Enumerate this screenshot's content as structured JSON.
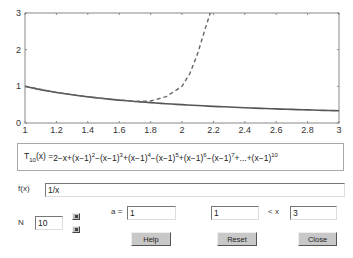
{
  "chart_data": {
    "type": "line",
    "title": "",
    "xlabel": "",
    "ylabel": "",
    "xlim": [
      1,
      3
    ],
    "ylim": [
      0,
      3
    ],
    "grid": false,
    "x_ticks": [
      "1",
      "1.2",
      "1.4",
      "1.6",
      "1.8",
      "2",
      "2.2",
      "2.4",
      "2.6",
      "2.8",
      "3"
    ],
    "y_ticks": [
      "0",
      "1",
      "2",
      "3"
    ],
    "series": [
      {
        "name": "f(x) = 1/x",
        "style": "solid",
        "x": [
          1.0,
          1.2,
          1.4,
          1.6,
          1.8,
          2.0,
          2.2,
          2.4,
          2.6,
          2.8,
          3.0
        ],
        "y": [
          1.0,
          0.833,
          0.714,
          0.625,
          0.556,
          0.5,
          0.455,
          0.417,
          0.385,
          0.357,
          0.333
        ]
      },
      {
        "name": "T10(x)",
        "style": "dashed",
        "x": [
          1.0,
          1.2,
          1.4,
          1.6,
          1.7,
          1.8,
          1.9,
          2.0,
          2.05,
          2.1,
          2.15,
          2.18
        ],
        "y": [
          1.0,
          0.833,
          0.714,
          0.625,
          0.59,
          0.6,
          0.72,
          1.0,
          1.35,
          1.9,
          2.6,
          3.0
        ]
      }
    ]
  },
  "formula": {
    "lhs_T": "T",
    "lhs_sub": "10",
    "lhs_arg": "(x) = ",
    "terms": [
      {
        "text": "2−x+(x−1)",
        "sup": "2"
      },
      {
        "text": "−(x−1)",
        "sup": "3"
      },
      {
        "text": "+(x−1)",
        "sup": "4"
      },
      {
        "text": "−(x−1)",
        "sup": "5"
      },
      {
        "text": "+(x−1)",
        "sup": "6"
      },
      {
        "text": "−(x−1)",
        "sup": "7"
      },
      {
        "text": "+...+(x−1)",
        "sup": "10"
      }
    ]
  },
  "controls": {
    "fx_label": "f(x)",
    "fx_value": "1/x",
    "a_label": "a =",
    "a_value": "1",
    "xmin_value": "1",
    "lt_x_label": "< x",
    "xmax_value": "3",
    "n_label": "N",
    "n_value": "10",
    "help_label": "Help",
    "reset_label": "Reset",
    "close_label": "Close"
  }
}
